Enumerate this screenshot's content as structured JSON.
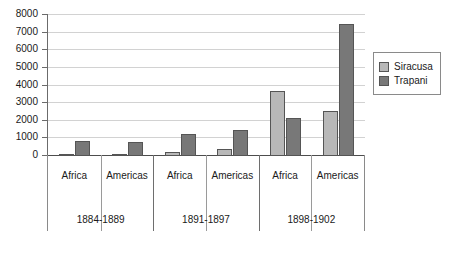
{
  "chart_data": {
    "type": "bar",
    "title": "",
    "subtitle": "",
    "xlabel": "",
    "ylabel": "",
    "ylim": [
      0,
      8000
    ],
    "ytick_labels": [
      "8000",
      "7000",
      "6000",
      "5000",
      "4000",
      "3000",
      "2000",
      "1000",
      "0"
    ],
    "ytick_values": [
      8000,
      7000,
      6000,
      5000,
      4000,
      3000,
      2000,
      1000,
      0
    ],
    "grid": true,
    "legend_position": "right",
    "categories": [
      "Africa",
      "Americas",
      "Africa",
      "Americas",
      "Africa",
      "Americas"
    ],
    "groups": [
      {
        "period": "1884-1889",
        "categories": [
          "Africa",
          "Americas"
        ]
      },
      {
        "period": "1891-1897",
        "categories": [
          "Africa",
          "Americas"
        ]
      },
      {
        "period": "1898-1902",
        "categories": [
          "Africa",
          "Americas"
        ]
      }
    ],
    "series": [
      {
        "name": "Siracusa",
        "color": "#b8b8b8",
        "values": [
          60,
          10,
          200,
          400,
          3700,
          2550
        ]
      },
      {
        "name": "Trapani",
        "color": "#787878",
        "values": [
          850,
          800,
          1250,
          1450,
          2150,
          7500
        ]
      }
    ]
  },
  "legend": {
    "items": [
      {
        "label": "Siracusa",
        "swatch": "siracusa"
      },
      {
        "label": "Trapani",
        "swatch": "trapani"
      }
    ]
  },
  "colors": {
    "siracusa": "#b8b8b8",
    "trapani": "#787878",
    "grid": "#d2d2d2",
    "axis": "#4d4d4d",
    "text": "#1a1a1a",
    "background": "#ffffff"
  }
}
